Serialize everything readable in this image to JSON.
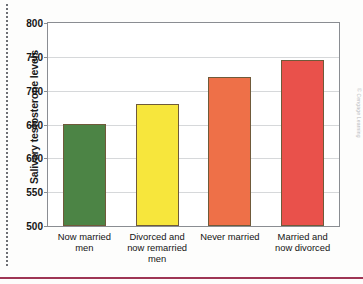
{
  "page": {
    "credit_text": "© Cengage Learning"
  },
  "chart_data": {
    "type": "bar",
    "title": "",
    "xlabel": "",
    "ylabel": "Salivary testosterone levels",
    "categories": [
      "Now married\nmen",
      "Divorced and\nnow remarried\nmen",
      "Never married",
      "Married and\nnow divorced"
    ],
    "values": [
      651,
      680,
      720,
      745
    ],
    "ylim": [
      500,
      800
    ],
    "yticks": [
      500,
      550,
      600,
      650,
      700,
      750,
      800
    ],
    "ytick_labels": [
      "500",
      "550",
      "600",
      "650",
      "700",
      "750",
      "800"
    ],
    "grid": true,
    "legend": "none",
    "bar_colors": [
      "#4c8445",
      "#f7e63c",
      "#ee7048",
      "#e9514b"
    ],
    "bar_border_color": "#6f5a3a",
    "axis_color": "#8a8d92",
    "gridline_color": "#d6d8da"
  }
}
